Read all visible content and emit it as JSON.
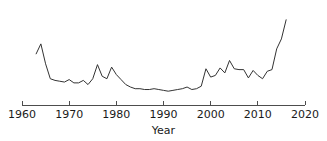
{
  "chart_data": {
    "type": "line",
    "title": "",
    "subtitle": "",
    "xlabel": "Year",
    "ylabel": "",
    "xlim": [
      1960,
      2020
    ],
    "ylim": [
      0,
      1
    ],
    "xticks": [
      1960,
      1970,
      1980,
      1990,
      2000,
      2010,
      2020
    ],
    "xticklabels": [
      "1960",
      "1970",
      "1980",
      "1990",
      "2000",
      "2010",
      "2020"
    ],
    "yticks": [],
    "yticklabels": [],
    "grid": false,
    "legend": null,
    "annotations": [],
    "line_color": "#333333",
    "axis_color": "#4d4d4d",
    "background_color": "#ffffff",
    "series": [
      {
        "name": "value",
        "x": [
          1963,
          1964,
          1965,
          1966,
          1967,
          1968,
          1969,
          1970,
          1971,
          1972,
          1973,
          1974,
          1975,
          1976,
          1977,
          1978,
          1979,
          1980,
          1981,
          1982,
          1983,
          1984,
          1985,
          1986,
          1987,
          1988,
          1989,
          1990,
          1991,
          1992,
          1993,
          1994,
          1995,
          1996,
          1997,
          1998,
          1999,
          2000,
          2001,
          2002,
          2003,
          2004,
          2005,
          2006,
          2007,
          2008,
          2009,
          2010,
          2011,
          2012,
          2013,
          2014,
          2015,
          2016
        ],
        "values": [
          0.52,
          0.64,
          0.4,
          0.22,
          0.2,
          0.19,
          0.18,
          0.21,
          0.17,
          0.17,
          0.2,
          0.15,
          0.22,
          0.39,
          0.25,
          0.22,
          0.36,
          0.27,
          0.21,
          0.15,
          0.12,
          0.1,
          0.1,
          0.09,
          0.09,
          0.1,
          0.09,
          0.08,
          0.07,
          0.08,
          0.09,
          0.1,
          0.12,
          0.09,
          0.1,
          0.13,
          0.34,
          0.24,
          0.26,
          0.35,
          0.29,
          0.44,
          0.34,
          0.33,
          0.33,
          0.23,
          0.32,
          0.26,
          0.22,
          0.31,
          0.33,
          0.58,
          0.7,
          0.93
        ]
      }
    ]
  }
}
